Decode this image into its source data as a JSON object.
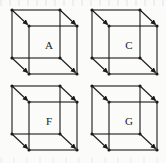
{
  "figure": {
    "background_color": "#fbfbfa",
    "line_color": "#1a1a1a",
    "label_color": "#1a1a1a",
    "columns": 2,
    "rows": 2
  },
  "cubes": [
    {
      "id": "cube-a",
      "label": "A",
      "position": "top-left",
      "x": 8,
      "y": 6,
      "arrow_count": 4,
      "arrow_direction": "front-bottom-right"
    },
    {
      "id": "cube-c",
      "label": "C",
      "position": "top-right",
      "x": 88,
      "y": 6,
      "arrow_count": 4,
      "arrow_direction": "front-bottom-right"
    },
    {
      "id": "cube-f",
      "label": "F",
      "position": "bottom-left",
      "x": 8,
      "y": 82,
      "arrow_count": 4,
      "arrow_direction": "front-bottom-right"
    },
    {
      "id": "cube-g",
      "label": "G",
      "position": "bottom-right",
      "x": 88,
      "y": 82,
      "arrow_count": 4,
      "arrow_direction": "front-bottom-right"
    }
  ]
}
